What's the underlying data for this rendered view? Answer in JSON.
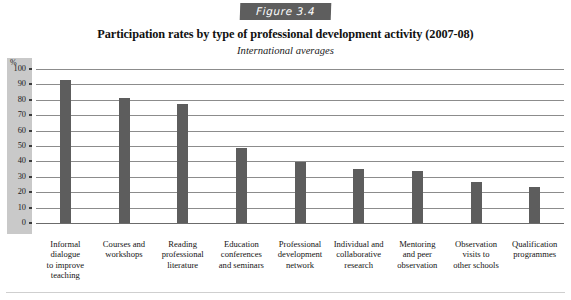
{
  "figure": {
    "badge_label": "Figure 3.4"
  },
  "titles": {
    "main": "Participation rates by type of professional development activity (2007-08)",
    "subtitle": "International averages"
  },
  "axis": {
    "y_unit_label": "%",
    "y_ticks": [
      "100",
      "90",
      "80",
      "70",
      "60",
      "50",
      "40",
      "30",
      "20",
      "10",
      "0"
    ]
  },
  "colors": {
    "bar": "#5d5d5d",
    "badge_background": "#5e5e5e",
    "grid": "#8c8c8c",
    "axis_band": "#c9c9c9"
  },
  "chart_data": {
    "type": "bar",
    "title": "Participation rates by type of professional development activity (2007-08)",
    "subtitle": "International averages",
    "xlabel": "",
    "ylabel": "%",
    "ylim": [
      0,
      100
    ],
    "ytick_step": 10,
    "grid": true,
    "legend": "none",
    "categories": [
      "Informal dialogue to improve teaching",
      "Courses and workshops",
      "Reading professional literature",
      "Education conferences and seminars",
      "Professional development network",
      "Individual and collaborative research",
      "Mentoring and peer observation",
      "Observation visits to other schools",
      "Qualification programmes"
    ],
    "category_lines": [
      [
        "Informal",
        "dialogue",
        "to improve",
        "teaching"
      ],
      [
        "Courses and",
        "workshops"
      ],
      [
        "Reading",
        "professional",
        "literature"
      ],
      [
        "Education",
        "conferences",
        "and seminars"
      ],
      [
        "Professional",
        "development",
        "network"
      ],
      [
        "Individual and",
        "collaborative",
        "research"
      ],
      [
        "Mentoring",
        "and peer",
        "observation"
      ],
      [
        "Observation",
        "visits to",
        "other schools"
      ],
      [
        "Qualification",
        "programmes"
      ]
    ],
    "values": [
      93,
      81,
      77.5,
      48.5,
      39.5,
      35,
      34,
      26.5,
      23.5
    ]
  }
}
